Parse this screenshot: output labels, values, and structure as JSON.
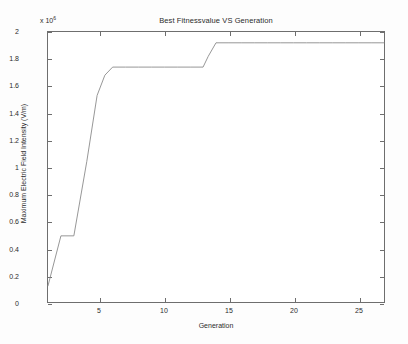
{
  "chart_data": {
    "type": "line",
    "title": "Best Fitnessvalue VS Generation",
    "xlabel": "Generation",
    "ylabel": "Maximum Electric Field Intensity (V/m)",
    "y_multiplier": "x 10",
    "y_exponent": "6",
    "xlim": [
      1,
      27
    ],
    "ylim": [
      0,
      2
    ],
    "xticks": [
      5,
      10,
      15,
      20,
      25
    ],
    "yticks": [
      0,
      0.2,
      0.4,
      0.6,
      0.8,
      1,
      1.2,
      1.4,
      1.6,
      1.8,
      2
    ],
    "xtick_labels": [
      "5",
      "10",
      "15",
      "20",
      "25"
    ],
    "ytick_labels": [
      "0",
      "0.2",
      "0.4",
      "0.6",
      "0.8",
      "1",
      "1.2",
      "1.4",
      "1.6",
      "1.8",
      "2"
    ],
    "grid": false,
    "legend": null,
    "line_color": "#8a8a8a",
    "series": [
      {
        "name": "Best Fitness Value",
        "x": [
          1,
          2,
          3,
          4,
          4.8,
          5.4,
          6,
          7,
          8,
          9,
          10,
          11,
          12,
          13,
          13.4,
          14,
          15,
          16,
          17,
          18,
          19,
          20,
          21,
          22,
          23,
          24,
          25,
          26,
          27
        ],
        "values": [
          0.12,
          0.49,
          0.49,
          1.04,
          1.53,
          1.68,
          1.74,
          1.74,
          1.74,
          1.74,
          1.74,
          1.74,
          1.74,
          1.74,
          1.82,
          1.92,
          1.92,
          1.92,
          1.92,
          1.92,
          1.92,
          1.92,
          1.92,
          1.92,
          1.92,
          1.92,
          1.92,
          1.92,
          1.92
        ]
      }
    ]
  },
  "figure": {
    "background": "#fdfdfd",
    "axes_color": "#6e6e6e",
    "text_color": "#2b2b2b"
  }
}
